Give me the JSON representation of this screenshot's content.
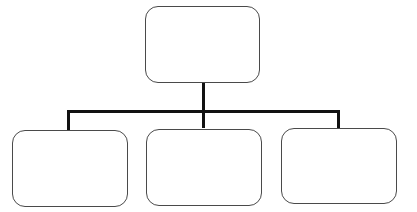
{
  "diagram": {
    "type": "org-chart",
    "colors": {
      "box_border": "#4a4a4a",
      "connector": "#111111",
      "background": "#ffffff"
    },
    "nodes": [
      {
        "id": "root",
        "label": "",
        "level": 0
      },
      {
        "id": "child-1",
        "label": "",
        "level": 1
      },
      {
        "id": "child-2",
        "label": "",
        "level": 1
      },
      {
        "id": "child-3",
        "label": "",
        "level": 1
      }
    ],
    "edges": [
      {
        "from": "root",
        "to": "child-1"
      },
      {
        "from": "root",
        "to": "child-2"
      },
      {
        "from": "root",
        "to": "child-3"
      }
    ]
  }
}
